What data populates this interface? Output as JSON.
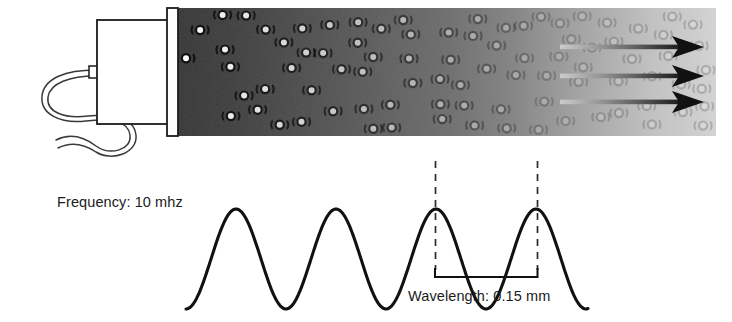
{
  "figure": {
    "width": 732,
    "height": 322,
    "background_color": "#ffffff"
  },
  "labels": {
    "frequency": "Frequency: 10 mhz",
    "wavelength": "Wavelength: 0.15 mm"
  },
  "transducer": {
    "body_label": "transducer-body",
    "body_fill": "#ffffff",
    "outline_color": "#1b1b1b",
    "faceplate_label": "crystal-faceplate",
    "faceplate_fill": "#fdfdfd",
    "cable_label": "transducer-cable",
    "cable_color": "#3a3a3a"
  },
  "beam": {
    "label": "ultrasound-beam",
    "x_start": 178,
    "x_end": 716,
    "y_top": 8,
    "y_bottom": 136,
    "gradient_near_color": "#3a3a3a",
    "gradient_mid_color": "#6e6e6e",
    "gradient_far_color": "#d2d2d2",
    "molecule_fill": "#ffffff",
    "molecule_ring": "#101010",
    "molecule_count": 86
  },
  "arrows": {
    "label": "propagation-arrows",
    "count": 3,
    "tail_color": "#c6c6c6",
    "head_color": "#111111",
    "x_tail": 560,
    "x_tip": 704,
    "y_positions": [
      47,
      76,
      102
    ]
  },
  "waveform": {
    "label": "sine-waveform",
    "stroke_color": "#111111",
    "stroke_width": 3.1,
    "x_start": 186,
    "x_end": 589,
    "baseline_y": 259,
    "amplitude": 50,
    "peak_count": 4,
    "peak_x_positions": [
      236,
      337,
      436,
      537
    ],
    "period_px": 100
  },
  "measurement": {
    "label": "wavelength-measurement",
    "dashed_line_color": "#2b2b2b",
    "bracket_color": "#111111",
    "left_x": 435,
    "right_x": 537,
    "dash_top_y": 161,
    "dash_bottom_y": 270,
    "bracket_y": 277,
    "tick_height": 9
  },
  "chart_data": {
    "type": "line",
    "xlabel": "",
    "ylabel": "",
    "series": [
      {
        "name": "sine wave",
        "description": "Four-peak sinusoid representing a 10 mhz ultrasound wave",
        "peaks": 4,
        "period_mm": 0.15,
        "frequency_mhz": 10
      }
    ],
    "annotations": [
      "Frequency: 10 mhz",
      "Wavelength: 0.15 mm"
    ],
    "grid": false,
    "legend": "none"
  }
}
